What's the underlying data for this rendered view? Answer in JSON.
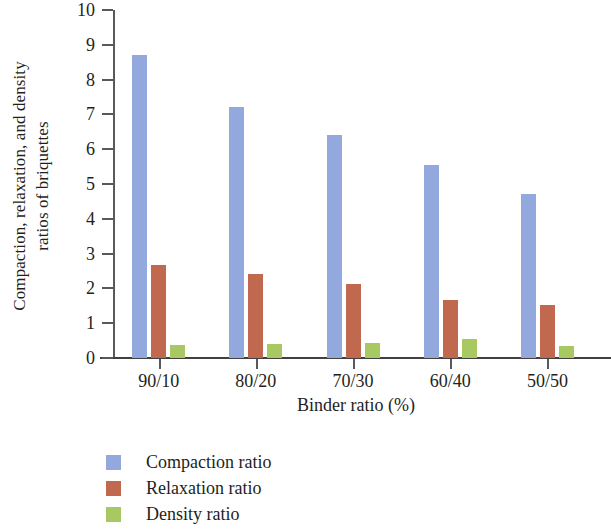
{
  "chart_data": {
    "type": "bar",
    "title": "",
    "subtitle": "",
    "xlabel": "Binder ratio (%)",
    "ylabel": "Compaction, relaxation, and density ratios of briquettes",
    "ylabel_line1": "Compaction, relaxation, and density",
    "ylabel_line2": "ratios of briquettes",
    "categories": [
      "90/10",
      "80/20",
      "70/30",
      "60/40",
      "50/50"
    ],
    "series": [
      {
        "name": "Compaction ratio",
        "color": "#93a9dd",
        "values": [
          8.7,
          7.2,
          6.4,
          5.55,
          4.7
        ]
      },
      {
        "name": "Relaxation ratio",
        "color": "#c1694f",
        "values": [
          2.67,
          2.41,
          2.13,
          1.67,
          1.52
        ]
      },
      {
        "name": "Density ratio",
        "color": "#a8c862",
        "values": [
          0.37,
          0.4,
          0.43,
          0.55,
          0.35
        ]
      }
    ],
    "ylim": [
      0,
      10
    ],
    "ytick_labels": [
      "10",
      "9",
      "8",
      "7",
      "6",
      "5",
      "4",
      "3",
      "2",
      "1",
      "0"
    ],
    "ytick_values": [
      10,
      9,
      8,
      7,
      6,
      5,
      4,
      3,
      2,
      1,
      0
    ],
    "grid": false,
    "legend_position": "bottom-left",
    "legend": [
      "Compaction ratio",
      "Relaxation ratio",
      "Density ratio"
    ]
  }
}
